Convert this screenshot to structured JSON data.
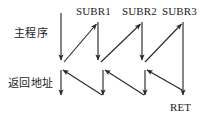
{
  "diagram": {
    "type": "flow-diagram",
    "labels": {
      "main_program": "主程序",
      "return_address": "返回地址",
      "subr1": "SUBR1",
      "subr2": "SUBR2",
      "subr3": "SUBR3",
      "ret": "RET"
    },
    "colors": {
      "background": "#ffffff",
      "stroke": "#2b2b2b",
      "text": "#1c1c1c"
    },
    "columns": [
      {
        "name": "main-program",
        "x": 61,
        "label": "主程序"
      },
      {
        "name": "subr1",
        "x": 98,
        "label": "SUBR1"
      },
      {
        "name": "subr2",
        "x": 142,
        "label": "SUBR2"
      },
      {
        "name": "subr3",
        "x": 183,
        "label": "SUBR3"
      }
    ],
    "rows": [
      {
        "name": "call-band",
        "y_top": 13,
        "y_bottom": 62
      },
      {
        "name": "return-band",
        "y_top": 68,
        "y_bottom": 97
      }
    ],
    "arrows": [
      {
        "name": "main-entry-down",
        "from": [
          61,
          13
        ],
        "to": [
          61,
          62
        ],
        "kind": "vertical-down"
      },
      {
        "name": "call-subr1",
        "from": [
          63,
          62
        ],
        "to": [
          98,
          22
        ],
        "kind": "diagonal-up-right"
      },
      {
        "name": "subr1-body-down",
        "from": [
          98,
          22
        ],
        "to": [
          98,
          62
        ],
        "kind": "vertical-down"
      },
      {
        "name": "call-subr2",
        "from": [
          100,
          62
        ],
        "to": [
          142,
          22
        ],
        "kind": "diagonal-up-right"
      },
      {
        "name": "subr2-body-down",
        "from": [
          142,
          22
        ],
        "to": [
          142,
          62
        ],
        "kind": "vertical-down"
      },
      {
        "name": "call-subr3",
        "from": [
          144,
          62
        ],
        "to": [
          183,
          22
        ],
        "kind": "diagonal-up-right"
      },
      {
        "name": "subr3-body-down",
        "from": [
          183,
          22
        ],
        "to": [
          183,
          97
        ],
        "kind": "vertical-down"
      },
      {
        "name": "return-to-main",
        "from": [
          61,
          68
        ],
        "to": [
          61,
          97
        ],
        "kind": "vertical-down"
      },
      {
        "name": "return-arrow-1",
        "from": [
          103,
          97
        ],
        "to": [
          63,
          68
        ],
        "kind": "diagonal-up-left"
      },
      {
        "name": "return-level-1",
        "from": [
          103,
          70
        ],
        "to": [
          103,
          97
        ],
        "kind": "vertical-down"
      },
      {
        "name": "return-arrow-2",
        "from": [
          145,
          97
        ],
        "to": [
          105,
          70
        ],
        "kind": "diagonal-up-left"
      },
      {
        "name": "return-level-2",
        "from": [
          145,
          70
        ],
        "to": [
          145,
          97
        ],
        "kind": "vertical-down"
      },
      {
        "name": "return-arrow-3",
        "from": [
          183,
          90
        ],
        "to": [
          147,
          70
        ],
        "kind": "diagonal-up-left"
      }
    ]
  }
}
